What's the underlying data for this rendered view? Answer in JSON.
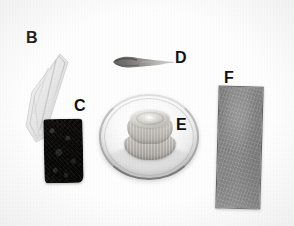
{
  "figure": {
    "background_color": "#ffffff",
    "width_px": 294,
    "height_px": 226
  },
  "labels": [
    {
      "id": "B",
      "text": "B",
      "x": 26,
      "y": 30,
      "color": "#121212"
    },
    {
      "id": "C",
      "text": "C",
      "x": 74,
      "y": 98,
      "color": "#121212"
    },
    {
      "id": "D",
      "text": "D",
      "x": 175,
      "y": 50,
      "color": "#121212"
    },
    {
      "id": "E",
      "text": "E",
      "x": 176,
      "y": 117,
      "color": "#121212"
    },
    {
      "id": "F",
      "text": "F",
      "x": 224,
      "y": 70,
      "color": "#121212"
    }
  ],
  "specimens": [
    {
      "id": "B",
      "name": "translucent-cone-tip",
      "description": "Pale translucent tapered plastic cone / pipette tip",
      "color": "#e9e9e9",
      "bbox": [
        18,
        52,
        52,
        92
      ]
    },
    {
      "id": "C",
      "name": "dark-foam-sponge",
      "description": "Dark porous foam sponge block",
      "color": "#242220",
      "bbox": [
        44,
        119,
        39,
        64
      ]
    },
    {
      "id": "D",
      "name": "tapered-brush-swab",
      "description": "Small dark tapered brush / swab head",
      "color": "#6e6c6a",
      "bbox": [
        108,
        52,
        70,
        22
      ]
    },
    {
      "id": "E",
      "name": "petri-dish-with-cap",
      "description": "Round shallow dish containing a ribbed screw cap",
      "color": "#f2f2f2",
      "bbox": [
        99,
        94,
        100,
        86
      ]
    },
    {
      "id": "F",
      "name": "grey-rectangular-strip",
      "description": "Grey rectangular abrasive strip / slide",
      "color": "#8f8f8f",
      "bbox": [
        217,
        86,
        45,
        123
      ]
    }
  ]
}
